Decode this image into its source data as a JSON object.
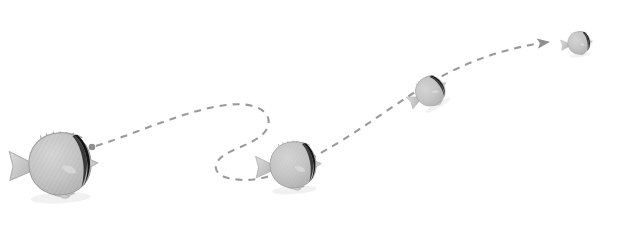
{
  "scene": {
    "title": "Butterflyfish swimming trajectory",
    "width": 623,
    "height": 229,
    "background_color": "#ffffff",
    "subject": "butterflyfish",
    "subject_count": 4,
    "style": "grayscale photographic cutouts with dashed motion path"
  },
  "palette": {
    "background": "#ffffff",
    "path_stroke": "#9a9a9a",
    "path_marker": "#8f8f8f",
    "body_light": "#d8d8d8",
    "body_mid": "#b4b4b4",
    "body_dark": "#9a9a9a",
    "stripe_dark": "#1a1a1a",
    "fin_light": "#cfcfcf",
    "outline": "#8c8c8c",
    "shadow": "#e6e6e6"
  },
  "path": {
    "label": "motion-trajectory",
    "stroke_color": "#9a9a9a",
    "stroke_width": 2.1,
    "dash_pattern": "7 6",
    "start_marker": "dot",
    "end_marker": "arrowhead",
    "start_point": [
      92,
      147
    ],
    "end_point": [
      559,
      42
    ],
    "arrowhead_angle_deg": -6,
    "d": "M 96 146 C 140 132 186 110 226 105 C 258 101 272 113 268 126 C 264 140 240 146 226 154 C 212 162 212 174 228 178 C 248 183 268 178 286 170 C 330 152 372 120 412 94 C 452 68 492 50 548 42"
  },
  "fish": [
    {
      "id": "fish-1",
      "name": "butterflyfish-near",
      "center": [
        57,
        164
      ],
      "scale": 1.0,
      "rotation_deg": -3,
      "size_label": "largest",
      "depth_order": "foreground",
      "facing": "right"
    },
    {
      "id": "fish-2",
      "name": "butterflyfish-mid",
      "center": [
        291,
        165
      ],
      "scale": 0.74,
      "rotation_deg": -4,
      "size_label": "large",
      "depth_order": "midground",
      "facing": "right"
    },
    {
      "id": "fish-3",
      "name": "butterflyfish-far",
      "center": [
        429,
        92
      ],
      "scale": 0.47,
      "rotation_deg": -30,
      "size_label": "small",
      "depth_order": "background",
      "facing": "upper-right"
    },
    {
      "id": "fish-4",
      "name": "butterflyfish-farthest",
      "center": [
        578,
        43
      ],
      "scale": 0.36,
      "rotation_deg": -8,
      "size_label": "smallest",
      "depth_order": "far-background",
      "facing": "right"
    }
  ]
}
